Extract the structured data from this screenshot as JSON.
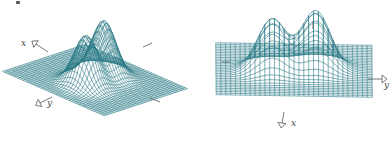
{
  "figure": {
    "colors": {
      "mesh": "#2b7b86",
      "axis": "#555555",
      "background": "#ffffff"
    },
    "panels": [
      {
        "id": "left",
        "description": "3D wireframe surface, bimodal peaks, oblique view",
        "axes": [
          {
            "label": "x",
            "label_pos": [
              21,
              44
            ],
            "arrow_from": [
              48,
              52
            ],
            "arrow_to": [
              36,
              44
            ]
          },
          {
            "label": "y",
            "label_pos": [
              47,
              104
            ],
            "arrow_from": [
              52,
              97
            ],
            "arrow_to": [
              40,
              103
            ]
          }
        ],
        "ticks": [
          {
            "from": [
              143,
              47
            ],
            "to": [
              152,
              43
            ]
          },
          {
            "from": [
              150,
              98
            ],
            "to": [
              160,
              102
            ]
          }
        ],
        "grid": 40,
        "view": {
          "cx": 95,
          "cy": 80,
          "sx": 62,
          "sy": 26,
          "rot": -0.55,
          "height": 54
        }
      },
      {
        "id": "right",
        "description": "3D wireframe surface, bimodal peaks, front view",
        "axes": [
          {
            "label": "y",
            "label_pos": [
              188,
              86
            ],
            "arrow_from": [
              172,
              79
            ],
            "arrow_to": [
              186,
              79
            ]
          },
          {
            "label": "x",
            "label_pos": [
              95,
              124
            ],
            "arrow_from": [
              88,
              112
            ],
            "arrow_to": [
              86,
              123
            ]
          }
        ],
        "ticks": [
          {
            "from": [
              26,
              62
            ],
            "to": [
              34,
              62
            ]
          },
          {
            "from": [
              117,
              21
            ],
            "to": [
              117,
              29
            ]
          }
        ],
        "grid": 32,
        "view": {
          "cx": 98,
          "cy": 70,
          "sx": 78,
          "sy": 26,
          "rot": 0.05,
          "height": 58
        }
      }
    ]
  }
}
